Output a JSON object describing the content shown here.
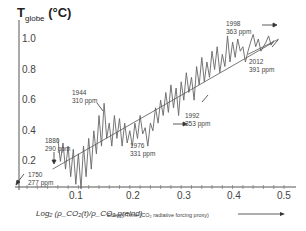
{
  "chart_data": {
    "type": "line",
    "title": "",
    "ylabel": "T_globe (°C)",
    "ylabel_main": "T",
    "ylabel_sub": "globe",
    "ylabel_unit": "(°C)",
    "xlabel_log": "Log₂ (ρ_CO₂(t)/ρ_CO₂,preind)",
    "xlabel": "Energy/Time (CO₂ radiative forcing proxy)",
    "xlim": [
      0,
      0.5
    ],
    "ylim": [
      0,
      1.05
    ],
    "x_ticks": [
      "0.1",
      "0.2",
      "0.3",
      "0.4",
      "0.5"
    ],
    "y_ticks": [
      "1.0",
      "0.8",
      "0.6",
      "0.4",
      "0.2"
    ],
    "series": [
      {
        "name": "Global temperature anomaly",
        "x": [
          0.06,
          0.065,
          0.07,
          0.075,
          0.08,
          0.085,
          0.09,
          0.095,
          0.1,
          0.105,
          0.11,
          0.115,
          0.12,
          0.125,
          0.13,
          0.135,
          0.14,
          0.145,
          0.15,
          0.155,
          0.16,
          0.165,
          0.17,
          0.175,
          0.18,
          0.185,
          0.19,
          0.195,
          0.2,
          0.205,
          0.21,
          0.215,
          0.22,
          0.225,
          0.23,
          0.235,
          0.24,
          0.245,
          0.25,
          0.255,
          0.26,
          0.265,
          0.27,
          0.275,
          0.28,
          0.285,
          0.29,
          0.295,
          0.3,
          0.305,
          0.31,
          0.315,
          0.32,
          0.325,
          0.33,
          0.335,
          0.34,
          0.345,
          0.35,
          0.355,
          0.36,
          0.365,
          0.37,
          0.375,
          0.38,
          0.385,
          0.39,
          0.395,
          0.4,
          0.405,
          0.41,
          0.415,
          0.42,
          0.425,
          0.43,
          0.435,
          0.44,
          0.445,
          0.45,
          0.455,
          0.46,
          0.465,
          0.47,
          0.475,
          0.48
        ],
        "values": [
          0.35,
          0.2,
          0.32,
          0.15,
          0.3,
          0.1,
          0.28,
          0.05,
          0.25,
          0.02,
          0.3,
          0.1,
          0.35,
          0.15,
          0.4,
          0.25,
          0.5,
          0.3,
          0.58,
          0.35,
          0.45,
          0.3,
          0.5,
          0.35,
          0.48,
          0.3,
          0.45,
          0.32,
          0.4,
          0.3,
          0.45,
          0.35,
          0.5,
          0.38,
          0.42,
          0.3,
          0.45,
          0.4,
          0.55,
          0.45,
          0.6,
          0.5,
          0.65,
          0.52,
          0.7,
          0.55,
          0.68,
          0.5,
          0.72,
          0.6,
          0.78,
          0.65,
          0.75,
          0.6,
          0.82,
          0.7,
          0.88,
          0.72,
          0.85,
          0.75,
          0.92,
          0.8,
          0.95,
          0.78,
          0.9,
          0.82,
          1.02,
          0.85,
          0.98,
          0.88,
          1.0,
          0.92,
          0.95,
          0.85,
          0.92,
          0.98,
          1.03,
          0.95,
          1.0,
          0.92,
          0.95,
          0.98,
          1.02,
          0.96,
          0.99
        ]
      },
      {
        "name": "Trend line (upper)",
        "x": [
          0.05,
          0.48
        ],
        "values": [
          0.15,
          0.98
        ]
      },
      {
        "name": "Trend line (lower, 2012 offset)",
        "x": [
          0.43,
          0.49
        ],
        "values": [
          0.9,
          1.0
        ]
      }
    ],
    "annotations": [
      {
        "year": "1750",
        "ppm": "277 ppm"
      },
      {
        "year": "1880",
        "ppm": "290 ppm"
      },
      {
        "year": "1944",
        "ppm": "310 ppm"
      },
      {
        "year": "1976",
        "ppm": "331 ppm"
      },
      {
        "year": "1992",
        "ppm": "353 ppm"
      },
      {
        "year": "1998",
        "ppm": "363 ppm"
      },
      {
        "year": "2012",
        "ppm": "391 ppm"
      }
    ],
    "grid": false,
    "legend": "none"
  },
  "arrow_label": "→"
}
